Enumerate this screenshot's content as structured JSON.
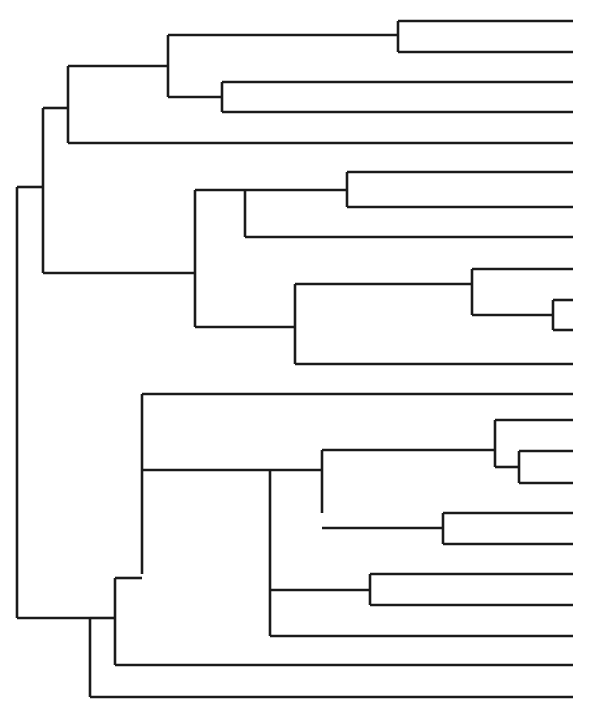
{
  "figure": {
    "title": "Hierarchical clustering dendrogram",
    "kind": "dendrogram",
    "width": 596,
    "height": 716,
    "background_color": "#ffffff",
    "line_color": "#1a1a1a",
    "line_width": 2.6,
    "orientation": "left-to-right",
    "leaf_tip_x": 573,
    "root_x": 17,
    "leaf_count": 24,
    "leaf_first_y": 21,
    "leaf_spacing": 30.35
  },
  "chart_data": {
    "type": "dendrogram",
    "title": "Hierarchical clustering dendrogram",
    "xlabel": "",
    "ylabel": "",
    "orientation": "left-to-right",
    "axis": "none",
    "grid": false,
    "legend": "none",
    "leaf_count": 24,
    "leaf_labels": [],
    "leaves": [
      {
        "id": "L1",
        "y": 21
      },
      {
        "id": "L2",
        "y": 52
      },
      {
        "id": "L3",
        "y": 82
      },
      {
        "id": "L4",
        "y": 112
      },
      {
        "id": "L5",
        "y": 143
      },
      {
        "id": "L6",
        "y": 172
      },
      {
        "id": "L7",
        "y": 207
      },
      {
        "id": "L8",
        "y": 237
      },
      {
        "id": "L9",
        "y": 269
      },
      {
        "id": "L10",
        "y": 300
      },
      {
        "id": "L11",
        "y": 330
      },
      {
        "id": "L12",
        "y": 364
      },
      {
        "id": "L13",
        "y": 394
      },
      {
        "id": "L14",
        "y": 420
      },
      {
        "id": "L15",
        "y": 451
      },
      {
        "id": "L16",
        "y": 483
      },
      {
        "id": "L17",
        "y": 513
      },
      {
        "id": "L18",
        "y": 544
      },
      {
        "id": "L19",
        "y": 574
      },
      {
        "id": "L20",
        "y": 605
      },
      {
        "id": "L21",
        "y": 636
      },
      {
        "id": "L22",
        "y": 665
      },
      {
        "id": "L23",
        "y": 697
      },
      {
        "id": "L24",
        "y": 712
      }
    ],
    "leaf_segments": [
      {
        "name": "leaf-1",
        "x1": 398,
        "x2": 573,
        "y": 21
      },
      {
        "name": "leaf-2",
        "x1": 398,
        "x2": 573,
        "y": 52
      },
      {
        "name": "leaf-3",
        "x1": 222,
        "x2": 573,
        "y": 82
      },
      {
        "name": "leaf-4",
        "x1": 222,
        "x2": 573,
        "y": 112
      },
      {
        "name": "leaf-5",
        "x1": 68,
        "x2": 573,
        "y": 143
      },
      {
        "name": "leaf-6",
        "x1": 347,
        "x2": 573,
        "y": 172
      },
      {
        "name": "leaf-7",
        "x1": 347,
        "x2": 573,
        "y": 207
      },
      {
        "name": "leaf-8",
        "x1": 245,
        "x2": 573,
        "y": 237
      },
      {
        "name": "leaf-9",
        "x1": 472,
        "x2": 573,
        "y": 269
      },
      {
        "name": "leaf-10",
        "x1": 553,
        "x2": 573,
        "y": 300
      },
      {
        "name": "leaf-11",
        "x1": 553,
        "x2": 573,
        "y": 330
      },
      {
        "name": "leaf-12",
        "x1": 295,
        "x2": 573,
        "y": 364
      },
      {
        "name": "leaf-13",
        "x1": 142,
        "x2": 573,
        "y": 394
      },
      {
        "name": "leaf-14",
        "x1": 495,
        "x2": 573,
        "y": 420
      },
      {
        "name": "leaf-15",
        "x1": 519,
        "x2": 573,
        "y": 451
      },
      {
        "name": "leaf-16",
        "x1": 519,
        "x2": 573,
        "y": 483
      },
      {
        "name": "leaf-17",
        "x1": 443,
        "x2": 573,
        "y": 513
      },
      {
        "name": "leaf-18",
        "x1": 443,
        "x2": 573,
        "y": 544
      },
      {
        "name": "leaf-19",
        "x1": 370,
        "x2": 573,
        "y": 574
      },
      {
        "name": "leaf-20",
        "x1": 370,
        "x2": 573,
        "y": 605
      },
      {
        "name": "leaf-21",
        "x1": 270,
        "x2": 573,
        "y": 636
      },
      {
        "name": "leaf-22",
        "x1": 115,
        "x2": 573,
        "y": 665
      },
      {
        "name": "leaf-23",
        "x1": 90,
        "x2": 573,
        "y": 697
      }
    ],
    "internal_nodes": [
      {
        "name": "node-root",
        "x": 17,
        "y_top": 187,
        "y_bottom": 618,
        "parent_x": 17,
        "depth": 0
      },
      {
        "name": "node-a",
        "x": 43,
        "y_top": 108,
        "y_bottom": 273,
        "parent_x": 17,
        "depth": 1
      },
      {
        "name": "node-b",
        "x": 68,
        "y_top": 66,
        "y_bottom": 143,
        "parent_x": 43,
        "depth": 2
      },
      {
        "name": "node-c",
        "x": 168,
        "y_top": 35,
        "y_bottom": 97,
        "parent_x": 68,
        "depth": 3
      },
      {
        "name": "node-d",
        "x": 398,
        "y_top": 21,
        "y_bottom": 52,
        "parent_x": 168,
        "depth": 4
      },
      {
        "name": "node-e",
        "x": 222,
        "y_top": 82,
        "y_bottom": 112,
        "parent_x": 168,
        "depth": 4
      },
      {
        "name": "node-f",
        "x": 195,
        "y_top": 190,
        "y_bottom": 327,
        "parent_x": 43,
        "depth": 2
      },
      {
        "name": "node-g",
        "x": 245,
        "y_top": 190,
        "y_bottom": 237,
        "parent_x": 195,
        "depth": 3
      },
      {
        "name": "node-h",
        "x": 347,
        "y_top": 172,
        "y_bottom": 207,
        "parent_x": 245,
        "depth": 4
      },
      {
        "name": "node-i",
        "x": 295,
        "y_top": 284,
        "y_bottom": 364,
        "parent_x": 195,
        "depth": 3
      },
      {
        "name": "node-j",
        "x": 472,
        "y_top": 269,
        "y_bottom": 315,
        "parent_x": 295,
        "depth": 4
      },
      {
        "name": "node-k",
        "x": 553,
        "y_top": 300,
        "y_bottom": 330,
        "parent_x": 472,
        "depth": 5
      },
      {
        "name": "node-l",
        "x": 90,
        "y_top": 618,
        "y_bottom": 697,
        "parent_x": 17,
        "depth": 1
      },
      {
        "name": "node-m",
        "x": 115,
        "y_top": 578,
        "y_bottom": 665,
        "parent_x": 90,
        "depth": 2
      },
      {
        "name": "node-n",
        "x": 142,
        "y_top": 394,
        "y_bottom": 574,
        "parent_x": 115,
        "depth": 3
      },
      {
        "name": "node-o",
        "x": 270,
        "y_top": 470,
        "y_bottom": 636,
        "parent_x": 142,
        "depth": 4
      },
      {
        "name": "node-p",
        "x": 322,
        "y_top": 450,
        "y_bottom": 513,
        "parent_x": 270,
        "depth": 5
      },
      {
        "name": "node-q",
        "x": 495,
        "y_top": 420,
        "y_bottom": 467,
        "parent_x": 322,
        "depth": 6
      },
      {
        "name": "node-r",
        "x": 519,
        "y_top": 451,
        "y_bottom": 483,
        "parent_x": 495,
        "depth": 7
      },
      {
        "name": "node-s",
        "x": 443,
        "y_top": 513,
        "y_bottom": 544,
        "parent_x": 322,
        "depth": 6
      },
      {
        "name": "node-t",
        "x": 370,
        "y_top": 574,
        "y_bottom": 605,
        "parent_x": 270,
        "depth": 5
      }
    ],
    "connectors": [
      {
        "name": "connector-root-upper",
        "x1": 17,
        "x2": 43,
        "y": 187
      },
      {
        "name": "connector-root-lower",
        "x1": 17,
        "x2": 90,
        "y": 618
      },
      {
        "name": "connector-a-upper",
        "x1": 43,
        "x2": 68,
        "y": 108
      },
      {
        "name": "connector-a-lower",
        "x1": 43,
        "x2": 195,
        "y": 273
      },
      {
        "name": "connector-b-upper",
        "x1": 68,
        "x2": 168,
        "y": 66
      },
      {
        "name": "connector-c-upper",
        "x1": 168,
        "x2": 398,
        "y": 35
      },
      {
        "name": "connector-c-lower",
        "x1": 168,
        "x2": 222,
        "y": 97
      },
      {
        "name": "connector-f-upper",
        "x1": 195,
        "x2": 245,
        "y": 190
      },
      {
        "name": "connector-f-lower",
        "x1": 195,
        "x2": 295,
        "y": 327
      },
      {
        "name": "connector-g-upper",
        "x1": 245,
        "x2": 347,
        "y": 190
      },
      {
        "name": "connector-i-upper",
        "x1": 295,
        "x2": 472,
        "y": 284
      },
      {
        "name": "connector-j-lower",
        "x1": 472,
        "x2": 553,
        "y": 315
      },
      {
        "name": "connector-l-upper",
        "x1": 90,
        "x2": 115,
        "y": 618
      },
      {
        "name": "connector-m-upper",
        "x1": 115,
        "x2": 142,
        "y": 578
      },
      {
        "name": "connector-n-lower",
        "x1": 142,
        "x2": 270,
        "y": 470
      },
      {
        "name": "connector-o-upper",
        "x1": 270,
        "x2": 322,
        "y": 470
      },
      {
        "name": "connector-o-lower",
        "x1": 270,
        "x2": 370,
        "y": 590
      },
      {
        "name": "connector-p-upper",
        "x1": 322,
        "x2": 495,
        "y": 450
      },
      {
        "name": "connector-p-lower",
        "x1": 322,
        "x2": 443,
        "y": 528
      },
      {
        "name": "connector-q-lower",
        "x1": 495,
        "x2": 519,
        "y": 467
      }
    ]
  }
}
